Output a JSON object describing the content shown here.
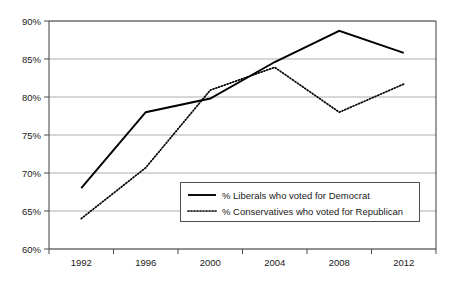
{
  "chart_data": {
    "type": "line",
    "title": "",
    "xlabel": "",
    "ylabel": "",
    "categories": [
      "1992",
      "1996",
      "2000",
      "2004",
      "2008",
      "2012"
    ],
    "ylim": [
      60,
      90
    ],
    "ytick_step": 5,
    "ytick_labels": [
      "90%",
      "85%",
      "80%",
      "75%",
      "70%",
      "65%",
      "60%"
    ],
    "ytick_values": [
      90,
      85,
      80,
      75,
      70,
      65,
      60
    ],
    "grid": true,
    "grid_axis": "y",
    "legend_position": "inside-lower-center-right",
    "series": [
      {
        "name": "% Liberals who voted for Democrat",
        "style": "solid",
        "color": "#000000",
        "values": [
          68.0,
          78.0,
          79.8,
          84.6,
          88.7,
          85.8
        ]
      },
      {
        "name": "% Conservatives who voted for Republican",
        "style": "dotted",
        "color": "#000000",
        "values": [
          64.0,
          70.7,
          80.9,
          83.9,
          78.0,
          81.7
        ]
      }
    ]
  },
  "legend": {
    "entries": [
      {
        "label": "% Liberals who voted for Democrat",
        "style": "solid"
      },
      {
        "label": "% Conservatives who voted for Republican",
        "style": "dotted"
      }
    ]
  },
  "axes": {
    "y_labels": [
      "90%",
      "85%",
      "80%",
      "75%",
      "70%",
      "65%",
      "60%"
    ],
    "x_labels": [
      "1992",
      "1996",
      "2000",
      "2004",
      "2008",
      "2012"
    ]
  }
}
